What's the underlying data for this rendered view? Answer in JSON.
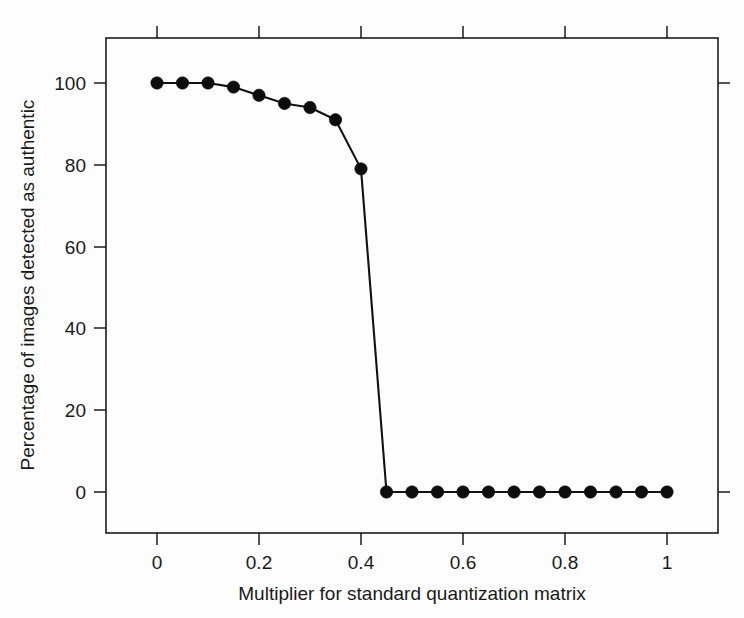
{
  "chart_data": {
    "type": "line",
    "title": "",
    "xlabel": "Multiplier for standard quantization matrix",
    "ylabel": "Percentage of images detected as authentic",
    "xlim": [
      -0.06,
      1.1
    ],
    "ylim": [
      -8,
      108
    ],
    "grid": false,
    "legend": null,
    "xticks": [
      0,
      0.2,
      0.4,
      0.6,
      0.8,
      1
    ],
    "xticklabels": [
      "0",
      "0.2",
      "0.4",
      "0.6",
      "0.8",
      "1"
    ],
    "yticks": [
      0,
      20,
      40,
      60,
      80,
      100
    ],
    "yticklabels": [
      "0",
      "20",
      "40",
      "60",
      "80",
      "100"
    ],
    "marker": "filled-circle",
    "line_color": "#111111",
    "marker_color": "#0d0d0d",
    "x": [
      0,
      0.05,
      0.1,
      0.15,
      0.2,
      0.25,
      0.3,
      0.35,
      0.4,
      0.45,
      0.5,
      0.55,
      0.6,
      0.65,
      0.7,
      0.75,
      0.8,
      0.85,
      0.9,
      0.95,
      1
    ],
    "y": [
      100,
      100,
      100,
      99,
      97,
      95,
      94,
      91,
      79,
      0,
      0,
      0,
      0,
      0,
      0,
      0,
      0,
      0,
      0,
      0,
      0
    ],
    "series": [
      {
        "name": "Percentage of images detected as authentic",
        "values": [
          100,
          100,
          100,
          99,
          97,
          95,
          94,
          91,
          79,
          0,
          0,
          0,
          0,
          0,
          0,
          0,
          0,
          0,
          0,
          0,
          0
        ]
      }
    ]
  },
  "figure": {
    "background_color": "#fdfdfd",
    "axis_color": "#1c1c1c"
  }
}
